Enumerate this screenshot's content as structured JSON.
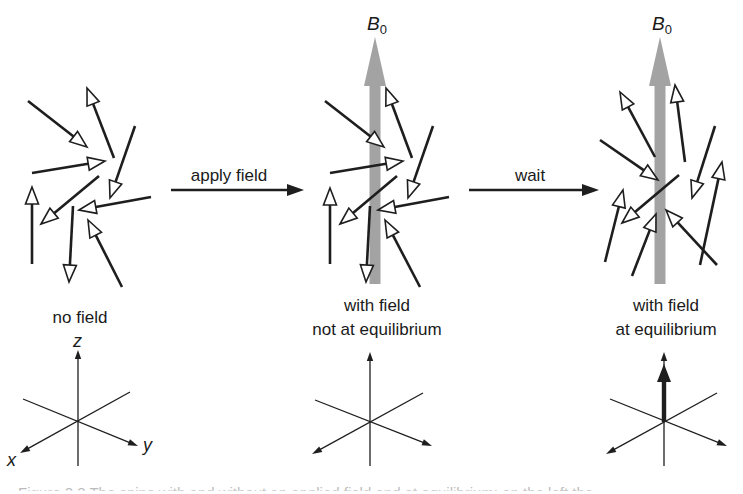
{
  "figure": {
    "panels": [
      {
        "id": "no-field",
        "label_lines": [
          "no field"
        ],
        "label_x": 80,
        "label_y": 308,
        "field": null,
        "spins": [
          {
            "tail": [
              28,
              101
            ],
            "tip": [
              87,
              147
            ]
          },
          {
            "tail": [
              114,
              158
            ],
            "tip": [
              87,
              88
            ]
          },
          {
            "tail": [
              135,
              126
            ],
            "tip": [
              110,
              198
            ]
          },
          {
            "tail": [
              32,
              173
            ],
            "tip": [
              105,
              161
            ]
          },
          {
            "tail": [
              99,
              176
            ],
            "tip": [
              41,
              224
            ]
          },
          {
            "tail": [
              151,
              197
            ],
            "tip": [
              79,
              210
            ]
          },
          {
            "tail": [
              32,
              264
            ],
            "tip": [
              32,
              187
            ]
          },
          {
            "tail": [
              73,
              206
            ],
            "tip": [
              69,
              282
            ]
          },
          {
            "tail": [
              122,
              287
            ],
            "tip": [
              88,
              220
            ]
          }
        ],
        "axes": {
          "origin": [
            78,
            422
          ],
          "z_tip": [
            78,
            350
          ],
          "z_bottom": [
            78,
            466
          ],
          "y_line": [
            [
              23,
              399
            ],
            [
              138,
              446
            ]
          ],
          "x_line": [
            [
              130,
              392
            ],
            [
              20,
              453
            ]
          ],
          "labels": {
            "z": "z",
            "x": "x",
            "y": "y"
          },
          "magnetization": null
        }
      },
      {
        "id": "not-equilibrium",
        "label_lines": [
          "with field",
          "not at equilibrium"
        ],
        "label_x": 377,
        "label_y": 296,
        "field": {
          "label": "B",
          "subscript": "0",
          "x": 375,
          "tip_y": 37,
          "head_base_y": 86,
          "bottom_y": 284,
          "label_y": 14
        },
        "spins": [
          {
            "tail": [
              325,
              101
            ],
            "tip": [
              384,
              147
            ]
          },
          {
            "tail": [
              412,
              158
            ],
            "tip": [
              386,
              88
            ]
          },
          {
            "tail": [
              433,
              126
            ],
            "tip": [
              408,
              198
            ]
          },
          {
            "tail": [
              330,
              173
            ],
            "tip": [
              403,
              161
            ]
          },
          {
            "tail": [
              397,
              176
            ],
            "tip": [
              340,
              224
            ]
          },
          {
            "tail": [
              449,
              197
            ],
            "tip": [
              378,
              210
            ]
          },
          {
            "tail": [
              330,
              264
            ],
            "tip": [
              330,
              188
            ]
          },
          {
            "tail": [
              370,
              206
            ],
            "tip": [
              366,
              282
            ]
          },
          {
            "tail": [
              420,
              287
            ],
            "tip": [
              385,
              220
            ]
          }
        ],
        "axes": {
          "origin": [
            370,
            422
          ],
          "z_tip": [
            370,
            352
          ],
          "z_bottom": [
            370,
            466
          ],
          "y_line": [
            [
              315,
              400
            ],
            [
              432,
              446
            ]
          ],
          "x_line": [
            [
              423,
              393
            ],
            [
              312,
              454
            ]
          ],
          "labels": null,
          "magnetization": null
        }
      },
      {
        "id": "at-equilibrium",
        "label_lines": [
          "with field",
          "at equilibrium"
        ],
        "label_x": 666,
        "label_y": 296,
        "field": {
          "label": "B",
          "subscript": "0",
          "x": 660,
          "tip_y": 37,
          "head_base_y": 86,
          "bottom_y": 284,
          "label_y": 14
        },
        "spins": [
          {
            "tail": [
              655,
              157
            ],
            "tip": [
              620,
              92
            ]
          },
          {
            "tail": [
              685,
              162
            ],
            "tip": [
              675,
              85
            ]
          },
          {
            "tail": [
              715,
              126
            ],
            "tip": [
              692,
              198
            ]
          },
          {
            "tail": [
              600,
              140
            ],
            "tip": [
              658,
              180
            ]
          },
          {
            "tail": [
              679,
              175
            ],
            "tip": [
              622,
              223
            ]
          },
          {
            "tail": [
              605,
              262
            ],
            "tip": [
              623,
              190
            ]
          },
          {
            "tail": [
              632,
              276
            ],
            "tip": [
              656,
              214
            ]
          },
          {
            "tail": [
              700,
              265
            ],
            "tip": [
              722,
              162
            ]
          },
          {
            "tail": [
              717,
              265
            ],
            "tip": [
              666,
              210
            ]
          }
        ],
        "axes": {
          "origin": [
            664,
            422
          ],
          "z_tip": [
            664,
            352
          ],
          "z_bottom": [
            664,
            466
          ],
          "y_line": [
            [
              610,
              399
            ],
            [
              727,
              446
            ]
          ],
          "x_line": [
            [
              717,
              393
            ],
            [
              606,
              454
            ]
          ],
          "labels": null,
          "magnetization": {
            "from": [
              664,
              422
            ],
            "tip": [
              664,
              364
            ]
          }
        }
      }
    ],
    "transitions": [
      {
        "label": "apply field",
        "x1": 171,
        "x2": 304,
        "y": 190,
        "label_x": 229,
        "label_y": 166
      },
      {
        "label": "wait",
        "x1": 469,
        "x2": 599,
        "y": 190,
        "label_x": 530,
        "label_y": 166
      }
    ],
    "caption_fragment": "Figure 2.3  The spins with and without an applied field and at equilibrium; on the left the"
  },
  "colors": {
    "ink": "#1e1e1e",
    "field_arrow": "#a3a3a3",
    "spin_head_fill": "#ffffff"
  }
}
